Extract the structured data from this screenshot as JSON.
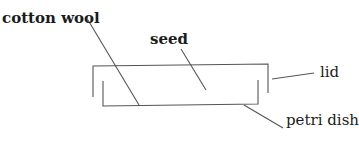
{
  "diagram": {
    "title": "",
    "type": "labelled apparatus diagram",
    "labels": {
      "cotton_wool": "cotton wool",
      "seed": "seed",
      "lid": "lid",
      "petri_dish": "petri dish"
    },
    "colors": {
      "line": "#555555",
      "text": "#1c1c1c",
      "background": "#ffffff"
    }
  }
}
